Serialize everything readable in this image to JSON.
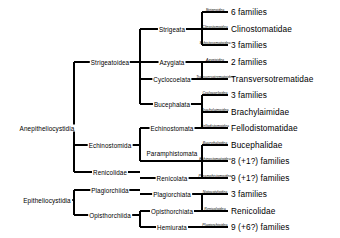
{
  "diagram": {
    "line_color": "#000000",
    "text_color": "#000000"
  },
  "roots": [
    {
      "id": "anepi",
      "label": "Anepitheliocystidia",
      "x": 47,
      "y": 128
    },
    {
      "id": "epi",
      "label": "Epitheliocystidia",
      "x": 47,
      "y": 196
    }
  ],
  "clades_level2": [
    {
      "id": "strigeatoidea",
      "label": "Strigeatoidea",
      "x": 110,
      "y": 64
    },
    {
      "id": "echinostomida",
      "label": "Echinostomida",
      "x": 110,
      "y": 144
    },
    {
      "id": "renicolidae",
      "label": "Renicolidae",
      "x": 110,
      "y": 177
    },
    {
      "id": "plagiorchiida",
      "label": "Plagiorchiida",
      "x": 110,
      "y": 190
    },
    {
      "id": "opisthorchiida",
      "label": "Opisthorchiida",
      "x": 110,
      "y": 214
    }
  ],
  "clades_level3": [
    {
      "id": "strigeata",
      "label": "Strigeata",
      "x": 172,
      "y": 29
    },
    {
      "id": "azygiata",
      "label": "Azygiata",
      "x": 172,
      "y": 62
    },
    {
      "id": "cyclocoelata",
      "label": "Cyclocoelata",
      "x": 172,
      "y": 79
    },
    {
      "id": "bucephalata",
      "label": "Bucephalata",
      "x": 172,
      "y": 104
    },
    {
      "id": "echinostomata",
      "label": "Echinostomata",
      "x": 172,
      "y": 128
    },
    {
      "id": "paramphistomata",
      "label": "Paramphistomata",
      "x": 172,
      "y": 153
    },
    {
      "id": "renicolata",
      "label": "Renicolata",
      "x": 172,
      "y": 177
    },
    {
      "id": "plagiorchiata",
      "label": "Plagiorchiata",
      "x": 172,
      "y": 194
    },
    {
      "id": "opisthorchiata",
      "label": "Opisthorchiata",
      "x": 172,
      "y": 211
    },
    {
      "id": "hemiurata",
      "label": "Hemiurata",
      "x": 172,
      "y": 227
    }
  ],
  "terminals": [
    {
      "id": "t1",
      "superfamily": "Strigeoidea",
      "result": "6 families",
      "y": 12,
      "branch_x": 228
    },
    {
      "id": "t2",
      "superfamily": "Clinostomoidea",
      "result": "Clinostomatidae",
      "y": 29,
      "branch_x": 228
    },
    {
      "id": "t3",
      "superfamily": "Schistosomatoidea",
      "result": "3 families",
      "y": 45,
      "branch_x": 228
    },
    {
      "id": "t4",
      "superfamily": "Azygioidea",
      "result": "2 families",
      "y": 62,
      "branch_x": 228
    },
    {
      "id": "t5",
      "superfamily": "Transversotrematoidea",
      "result": "Transversotrematidae",
      "y": 79,
      "branch_x": 228
    },
    {
      "id": "t6",
      "superfamily": "Cyclocoeloidea",
      "result": "3 families",
      "y": 95,
      "branch_x": 228
    },
    {
      "id": "t7",
      "superfamily": "Brachylaimoidea",
      "result": "Brachylaimidae",
      "y": 112,
      "branch_x": 228
    },
    {
      "id": "t8",
      "superfamily": "Fellodistomoidea",
      "result": "Fellodistomatidae",
      "y": 128,
      "branch_x": 228
    },
    {
      "id": "t9",
      "superfamily": "Bucephaloidea",
      "result": "Bucephalidae",
      "y": 145,
      "branch_x": 228
    },
    {
      "id": "t10",
      "superfamily": "Echinostomatoidea",
      "result": "8 (+1?) families",
      "y": 161,
      "branch_x": 228
    },
    {
      "id": "t11",
      "superfamily": "Paramphistomoidea",
      "result": "9 (+1?) families",
      "y": 178,
      "branch_x": 228
    },
    {
      "id": "t12",
      "superfamily": "Notocotyloidea",
      "result": "3 families",
      "y": 194,
      "branch_x": 228
    },
    {
      "id": "t13",
      "superfamily": "Renicoloidea",
      "result": "Renicolidae",
      "y": 211,
      "branch_x": 228
    },
    {
      "id": "t14",
      "superfamily": "Plagiorchioidea",
      "result": "9 (+6?) families",
      "y": 227,
      "branch_x": 228
    }
  ],
  "terminal_rows": [
    {
      "superfamily": "Strigeoidea",
      "result": "6 families"
    },
    {
      "superfamily": "Clinostomoidea",
      "result": "Clinostomatidae"
    },
    {
      "superfamily": "Schistosomatoidea",
      "result": "3 families"
    },
    {
      "superfamily": "Azygioidea",
      "result": "2 families"
    },
    {
      "superfamily": "Transversotrematoidea",
      "result": "Transversotrematidae"
    },
    {
      "superfamily": "Cyclocoeloidea",
      "result": "3 families"
    },
    {
      "superfamily": "Brachylaimoidea",
      "result": "Brachylaimidae"
    },
    {
      "superfamily": "Fellodistomoidea",
      "result": "Fellodistomatidae"
    },
    {
      "superfamily": "Bucephaloidea",
      "result": "Bucephalidae"
    },
    {
      "superfamily": "Echinostomatoidea",
      "result": "8 (+1?) families"
    },
    {
      "superfamily": "Paramphistomoidea",
      "result": "9 (+1?) families"
    },
    {
      "superfamily": "Notocotyloidea",
      "result": "3 families"
    },
    {
      "superfamily": "Renicoloidea",
      "result": "Renicolidae"
    },
    {
      "superfamily": "Plagiorchioidea",
      "result": "9 (+6?) families"
    },
    {
      "superfamily": "Allocreadioidea",
      "result": "7 (+4?) families"
    },
    {
      "superfamily": "Opisthorchioidea",
      "result": "6 families"
    },
    {
      "superfamily": "Hemiuroidea",
      "result": "9 families"
    }
  ]
}
